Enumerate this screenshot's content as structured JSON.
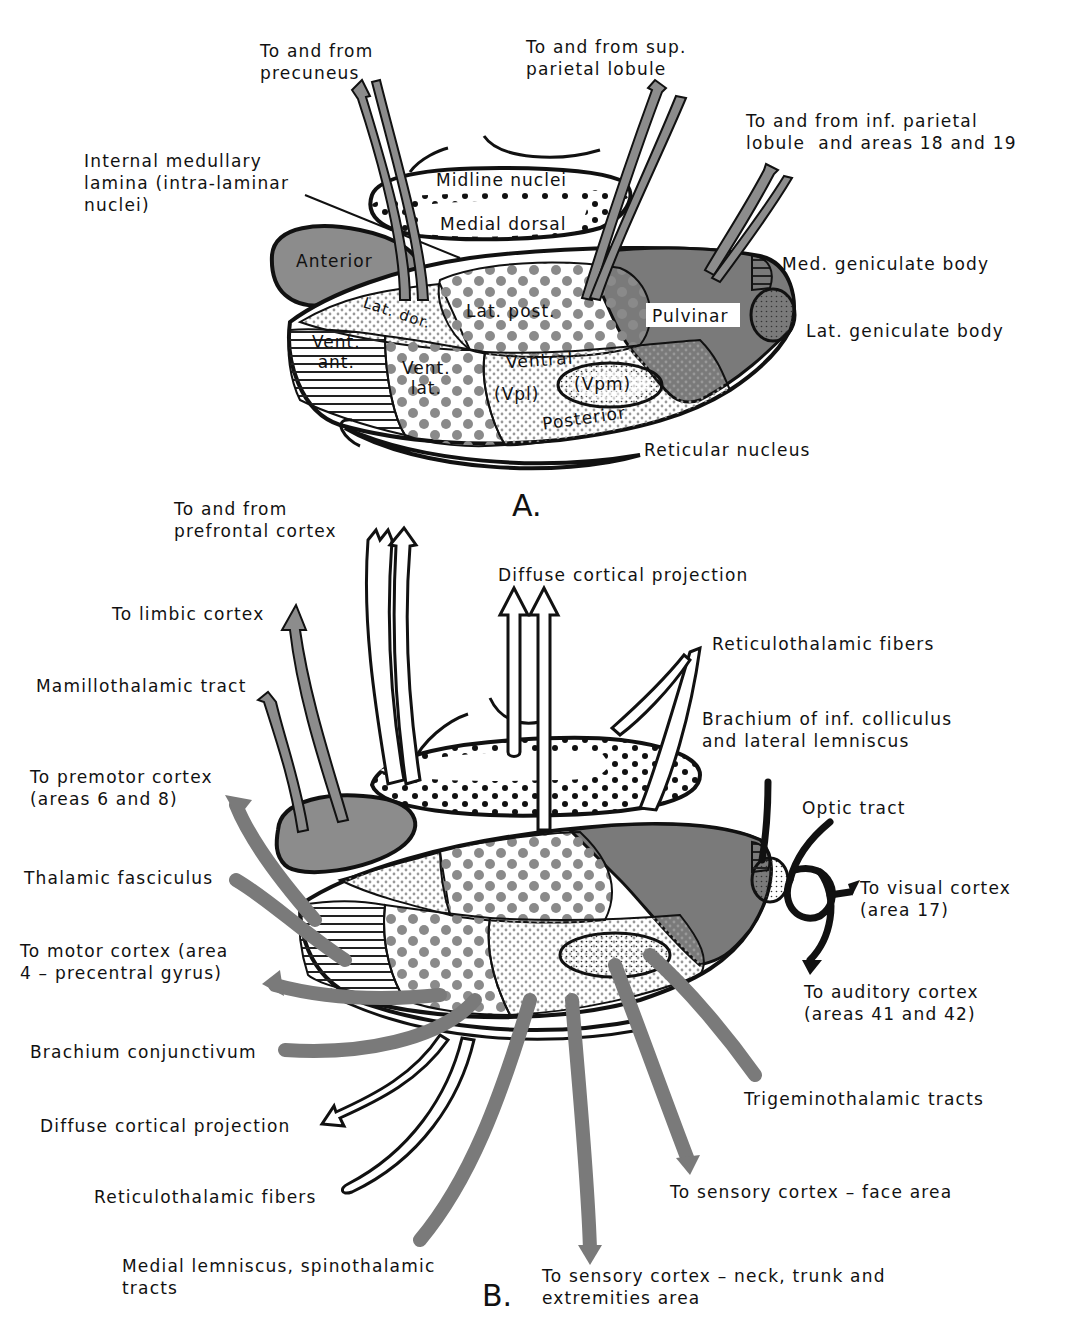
{
  "colors": {
    "gray_fill": "#8c8c8c",
    "dark_fill": "#7a7a7a",
    "dot_gray": "#8a8a8a",
    "ink": "#111111",
    "background": "#ffffff"
  },
  "panel_a": {
    "letter": "A.",
    "external_labels": {
      "precuneus": "To and from\nprecuneus",
      "sup_parietal": "To and from sup.\nparietal lobule",
      "inf_parietal": "To and from inf. parietal\nlobule  and areas 18 and 19",
      "internal_medullary": "Internal medullary\nlamina (intra-laminar\nnuclei)",
      "med_geniculate": "Med. geniculate body",
      "lat_geniculate": "Lat. geniculate body",
      "reticular": "Reticular nucleus"
    },
    "nuclei": {
      "midline": "Midline nuclei",
      "medial_dorsal": "Medial dorsal",
      "anterior": "Anterior",
      "lat_dor": "Lat. dor.",
      "lat_post": "Lat. post.",
      "pulvinar": "Pulvinar",
      "vent_ant": "Vent.\nant.",
      "vent_lat": "Vent.\nlat.",
      "ventral": "Ventral",
      "vpl": "(Vpl)",
      "vpm": "(Vpm)",
      "posterior": "Posterior"
    }
  },
  "panel_b": {
    "letter": "B.",
    "labels": {
      "prefrontal": "To and from\nprefrontal cortex",
      "diffuse_top": "Diffuse cortical projection",
      "limbic": "To limbic cortex",
      "mamillothalamic": "Mamillothalamic tract",
      "reticulothalamic_top": "Reticulothalamic fibers",
      "brachium_inf": "Brachium of inf. colliculus\nand lateral lemniscus",
      "premotor": "To premotor cortex\n(areas 6 and 8)",
      "optic_tract": "Optic tract",
      "thalamic_fasciculus": "Thalamic fasciculus",
      "visual_cortex": "To visual cortex\n(area 17)",
      "motor_cortex": "To motor cortex (area\n4 – precentral gyrus)",
      "auditory_cortex": "To auditory cortex\n(areas 41 and 42)",
      "brachium_conj": "Brachium conjunctivum",
      "diffuse_bottom": "Diffuse cortical projection",
      "trigeminothalamic": "Trigeminothalamic tracts",
      "reticulothalamic_bottom": "Reticulothalamic fibers",
      "sensory_face": "To sensory cortex – face area",
      "medial_lemniscus": "Medial lemniscus, spinothalamic\ntracts",
      "sensory_neck": "To sensory cortex – neck, trunk and\nextremities area"
    }
  }
}
